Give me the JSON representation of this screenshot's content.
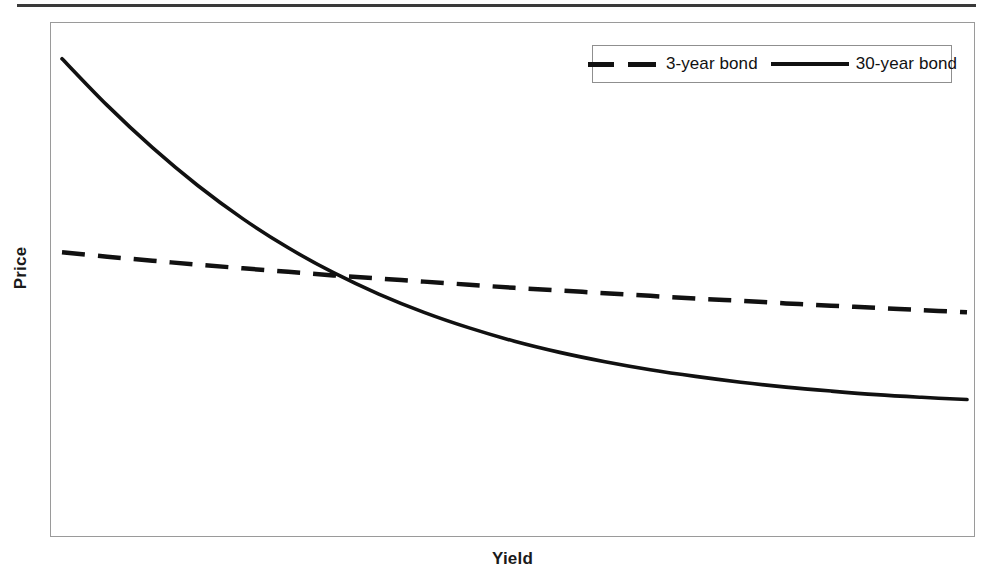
{
  "figure": {
    "has_top_rule": true,
    "frame_color": "#9a9a9a",
    "background": "#ffffff"
  },
  "chart_data": {
    "type": "line",
    "title": "",
    "subtitle": "",
    "xlabel": "Yield",
    "ylabel": "Price",
    "grid": false,
    "axis_ticks": false,
    "xlim": [
      0,
      100
    ],
    "ylim": [
      0,
      100
    ],
    "legend_position": "top-right",
    "annotations": [],
    "series": [
      {
        "name": "3-year bond",
        "style": "dashed",
        "color": "#111111",
        "linewidth": 4.5,
        "x": [
          0,
          5,
          10,
          15,
          20,
          25,
          30,
          35,
          40,
          45,
          50,
          55,
          60,
          65,
          70,
          75,
          80,
          85,
          90,
          95,
          100
        ],
        "y": [
          55.0,
          54.0,
          53.1,
          52.2,
          51.4,
          50.6,
          49.8,
          49.1,
          48.4,
          47.7,
          47.0,
          46.4,
          45.8,
          45.2,
          44.6,
          44.1,
          43.5,
          43.0,
          42.5,
          42.0,
          41.5
        ]
      },
      {
        "name": "30-year bond",
        "style": "solid",
        "color": "#111111",
        "linewidth": 3.6,
        "x": [
          0,
          5,
          10,
          15,
          20,
          25,
          30,
          35,
          40,
          45,
          50,
          55,
          60,
          65,
          70,
          75,
          80,
          85,
          90,
          95,
          100
        ],
        "y": [
          98.5,
          88.0,
          78.5,
          70.0,
          62.5,
          56.0,
          50.4,
          45.6,
          41.5,
          38.0,
          35.0,
          32.5,
          30.4,
          28.6,
          27.1,
          25.8,
          24.7,
          23.8,
          23.0,
          22.4,
          21.9
        ]
      }
    ],
    "crossover_note": "curves intersect near x=18"
  },
  "legend": {
    "entries": [
      {
        "label": "3-year bond",
        "style": "dashed"
      },
      {
        "label": "30-year bond",
        "style": "solid"
      }
    ]
  },
  "colors": {
    "line": "#111111",
    "frame": "#9a9a9a",
    "rule": "#3a3a3a",
    "text": "#1a1a1a"
  }
}
